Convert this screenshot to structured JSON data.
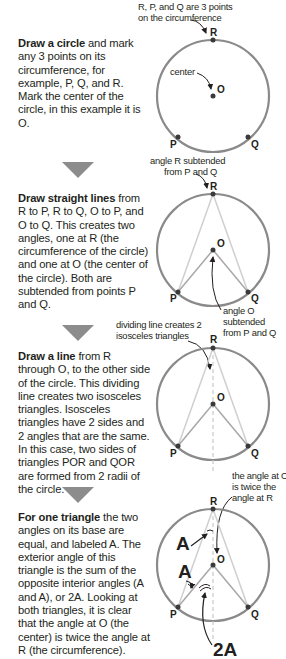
{
  "steps": [
    {
      "title": "Draw a circle",
      "body": " and mark any 3 points on its circumference, for example, P, Q, and R. Mark the center of the circle, in this example it is O."
    },
    {
      "title": "Draw straight lines",
      "body": " from R to P, R to Q, O to P, and O to Q. This creates two angles, one at R (the circumference of the circle) and one at O (the center of the circle). Both are subtended from points P and Q."
    },
    {
      "title": "Draw a line",
      "body": " from R through O, to the other side of the circle. This dividing line creates two isosceles triangles. Isosceles triangles have 2 sides and 2 angles that are the same. In this case, two sides of triangles POR and QOR are formed from 2 radii of the circle."
    },
    {
      "title": "For one triangle",
      "body": " the two angles on its base are equal, and labeled A. The exterior angle of this triangle is the sum of the opposite interior angles (A and A), or 2A. Looking at both triangles, it is clear that the angle at O (the center) is twice the angle at R (the circumference)."
    }
  ],
  "annotations": {
    "three_points_line1": "R, P, and Q are 3 points",
    "three_points_line2": "on the circumference",
    "center": "center",
    "angle_r_line1": "angle R subtended",
    "angle_r_line2": "from P and Q",
    "angle_o_line1": "angle O",
    "angle_o_line2": "subtended",
    "angle_o_line3": "from P and Q",
    "dividing_line1": "dividing line creates 2",
    "dividing_line2": "isosceles triangles",
    "twice_line1": "the angle at O",
    "twice_line2": "is twice the",
    "twice_line3": "angle at R"
  },
  "point_labels": {
    "R": "R",
    "P": "P",
    "Q": "Q",
    "O": "O"
  },
  "angle_labels": {
    "a": "A",
    "two_a": "2A"
  },
  "colors": {
    "circle": "#8a8a8a",
    "chord": "#c8c8c8",
    "radius": "#a0a0a0",
    "point": "#3a3a3a",
    "arrow": "#8c8c8c",
    "text": "#231f20"
  }
}
